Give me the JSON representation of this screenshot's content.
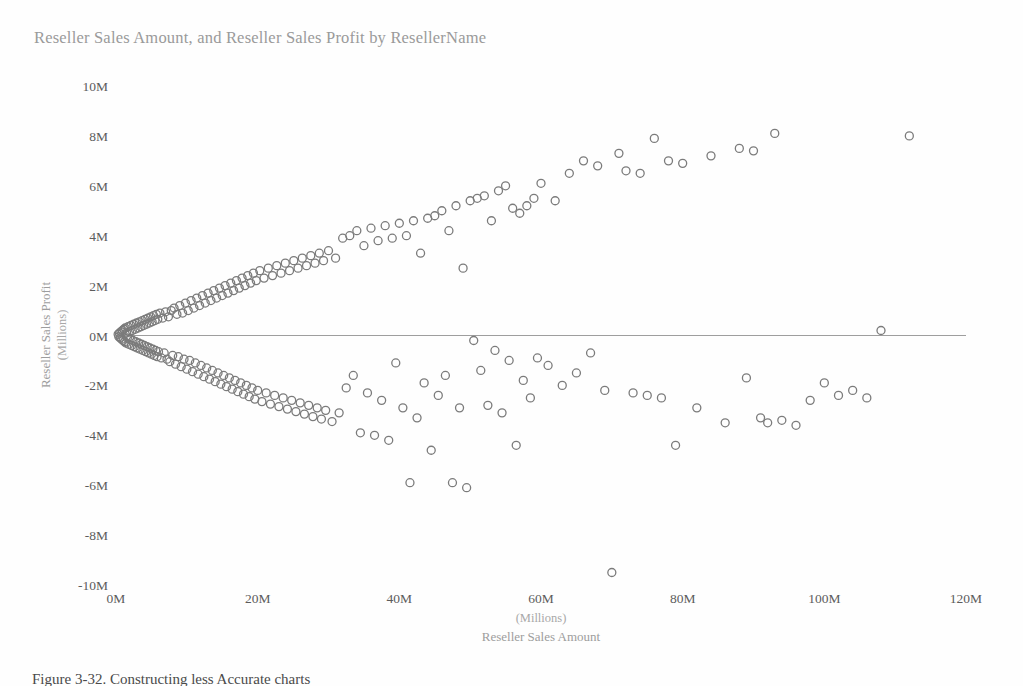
{
  "figure": {
    "title": "Reseller Sales Amount, and Reseller Sales Profit by ResellerName",
    "caption": "Figure 3-32.  Constructing less Accurate charts",
    "background_color": "#fefefe",
    "marker_color": "#7b7b7b",
    "title_color": "#9a9a9a",
    "tick_color": "#5c5c5c",
    "zero_line_color": "#9e9e9e"
  },
  "chart_data": {
    "type": "scatter",
    "title": "Reseller Sales Amount, and Reseller Sales Profit by ResellerName",
    "xlabel": "Reseller Sales Amount",
    "xlabel_units": "(Millions)",
    "ylabel": "Reseller Sales Profit",
    "ylabel_units": "(Millions)",
    "xlim": [
      0,
      120
    ],
    "ylim": [
      -10,
      10
    ],
    "xticks": [
      0,
      20,
      40,
      60,
      80,
      100,
      120
    ],
    "xtick_labels": [
      "0M",
      "20M",
      "40M",
      "60M",
      "80M",
      "100M",
      "120M"
    ],
    "yticks": [
      10,
      8,
      6,
      4,
      2,
      0,
      -2,
      -4,
      -6,
      -8,
      -10
    ],
    "ytick_labels": [
      "10M",
      "8M",
      "6M",
      "4M",
      "2M",
      "0M",
      "-2M",
      "-4M",
      "-6M",
      "-8M",
      "-10M"
    ],
    "grid": false,
    "zero_line": true,
    "legend": null,
    "marker": "open-circle",
    "marker_size": 8,
    "series": [
      {
        "name": "ResellerName",
        "points": [
          [
            0.3,
            0.05
          ],
          [
            0.4,
            -0.05
          ],
          [
            0.5,
            0.1
          ],
          [
            0.6,
            -0.1
          ],
          [
            0.7,
            0.15
          ],
          [
            0.8,
            -0.15
          ],
          [
            0.9,
            0.2
          ],
          [
            1.0,
            -0.2
          ],
          [
            1.1,
            0.25
          ],
          [
            1.2,
            -0.25
          ],
          [
            1.3,
            0.3
          ],
          [
            1.4,
            -0.3
          ],
          [
            1.5,
            0.1
          ],
          [
            1.6,
            -0.1
          ],
          [
            1.7,
            0.35
          ],
          [
            1.8,
            -0.35
          ],
          [
            1.9,
            0.15
          ],
          [
            2.0,
            -0.15
          ],
          [
            2.1,
            0.4
          ],
          [
            2.2,
            -0.4
          ],
          [
            2.3,
            0.2
          ],
          [
            2.4,
            -0.2
          ],
          [
            2.5,
            0.45
          ],
          [
            2.6,
            -0.45
          ],
          [
            2.7,
            0.25
          ],
          [
            2.8,
            -0.25
          ],
          [
            2.9,
            0.5
          ],
          [
            3.0,
            -0.5
          ],
          [
            3.1,
            0.3
          ],
          [
            3.2,
            -0.3
          ],
          [
            3.3,
            0.55
          ],
          [
            3.4,
            -0.55
          ],
          [
            3.5,
            0.35
          ],
          [
            3.6,
            -0.35
          ],
          [
            3.7,
            0.6
          ],
          [
            3.8,
            -0.6
          ],
          [
            3.9,
            0.4
          ],
          [
            4.0,
            -0.4
          ],
          [
            4.1,
            0.65
          ],
          [
            4.2,
            -0.65
          ],
          [
            4.3,
            0.45
          ],
          [
            4.4,
            -0.45
          ],
          [
            4.5,
            0.7
          ],
          [
            4.6,
            -0.7
          ],
          [
            4.7,
            0.5
          ],
          [
            4.8,
            -0.5
          ],
          [
            4.9,
            0.75
          ],
          [
            5.0,
            -0.75
          ],
          [
            5.1,
            0.55
          ],
          [
            5.2,
            -0.55
          ],
          [
            5.3,
            0.8
          ],
          [
            5.4,
            -0.8
          ],
          [
            5.5,
            0.6
          ],
          [
            5.6,
            -0.6
          ],
          [
            5.7,
            0.85
          ],
          [
            5.8,
            -0.85
          ],
          [
            5.9,
            0.65
          ],
          [
            6.0,
            -0.65
          ],
          [
            6.2,
            0.9
          ],
          [
            6.4,
            -0.9
          ],
          [
            6.6,
            0.7
          ],
          [
            6.8,
            -0.7
          ],
          [
            7.0,
            0.95
          ],
          [
            7.2,
            -0.95
          ],
          [
            7.4,
            0.75
          ],
          [
            7.6,
            -1.05
          ],
          [
            7.8,
            1.0
          ],
          [
            8.0,
            -0.8
          ],
          [
            8.2,
            1.1
          ],
          [
            8.4,
            -1.15
          ],
          [
            8.6,
            0.85
          ],
          [
            8.8,
            -0.85
          ],
          [
            9.0,
            1.2
          ],
          [
            9.2,
            -1.25
          ],
          [
            9.4,
            0.9
          ],
          [
            9.6,
            -0.95
          ],
          [
            9.8,
            1.3
          ],
          [
            10.0,
            -1.35
          ],
          [
            10.2,
            1.0
          ],
          [
            10.4,
            -1.0
          ],
          [
            10.6,
            1.4
          ],
          [
            10.8,
            -1.45
          ],
          [
            11.0,
            1.1
          ],
          [
            11.2,
            -1.1
          ],
          [
            11.4,
            1.5
          ],
          [
            11.6,
            -1.55
          ],
          [
            11.8,
            1.2
          ],
          [
            12.0,
            -1.2
          ],
          [
            12.2,
            1.6
          ],
          [
            12.4,
            -1.65
          ],
          [
            12.6,
            1.3
          ],
          [
            12.8,
            -1.3
          ],
          [
            13.0,
            1.7
          ],
          [
            13.2,
            -1.75
          ],
          [
            13.4,
            1.4
          ],
          [
            13.6,
            -1.4
          ],
          [
            13.8,
            1.8
          ],
          [
            14.0,
            -1.85
          ],
          [
            14.2,
            1.5
          ],
          [
            14.4,
            -1.5
          ],
          [
            14.6,
            1.9
          ],
          [
            14.8,
            -1.95
          ],
          [
            15.0,
            1.6
          ],
          [
            15.2,
            -1.6
          ],
          [
            15.4,
            2.0
          ],
          [
            15.6,
            -2.05
          ],
          [
            15.8,
            1.7
          ],
          [
            16.0,
            -1.7
          ],
          [
            16.2,
            2.1
          ],
          [
            16.4,
            -2.15
          ],
          [
            16.6,
            1.8
          ],
          [
            16.8,
            -1.8
          ],
          [
            17.0,
            2.2
          ],
          [
            17.2,
            -2.25
          ],
          [
            17.4,
            1.9
          ],
          [
            17.6,
            -1.9
          ],
          [
            17.8,
            2.3
          ],
          [
            18.0,
            -2.35
          ],
          [
            18.2,
            2.0
          ],
          [
            18.4,
            -2.0
          ],
          [
            18.6,
            2.4
          ],
          [
            18.8,
            -2.45
          ],
          [
            19.0,
            2.1
          ],
          [
            19.2,
            -2.1
          ],
          [
            19.4,
            2.5
          ],
          [
            19.6,
            -2.55
          ],
          [
            19.8,
            2.2
          ],
          [
            20.0,
            -2.2
          ],
          [
            20.3,
            2.6
          ],
          [
            20.6,
            -2.65
          ],
          [
            20.9,
            2.3
          ],
          [
            21.2,
            -2.3
          ],
          [
            21.5,
            2.7
          ],
          [
            21.8,
            -2.75
          ],
          [
            22.1,
            2.4
          ],
          [
            22.4,
            -2.4
          ],
          [
            22.7,
            2.8
          ],
          [
            23.0,
            -2.85
          ],
          [
            23.3,
            2.5
          ],
          [
            23.6,
            -2.5
          ],
          [
            23.9,
            2.9
          ],
          [
            24.2,
            -2.95
          ],
          [
            24.5,
            2.6
          ],
          [
            24.8,
            -2.6
          ],
          [
            25.1,
            3.0
          ],
          [
            25.4,
            -3.05
          ],
          [
            25.7,
            2.7
          ],
          [
            26.0,
            -2.7
          ],
          [
            26.3,
            3.1
          ],
          [
            26.6,
            -3.15
          ],
          [
            26.9,
            2.8
          ],
          [
            27.2,
            -2.8
          ],
          [
            27.5,
            3.2
          ],
          [
            27.8,
            -3.25
          ],
          [
            28.1,
            2.9
          ],
          [
            28.4,
            -2.9
          ],
          [
            28.7,
            3.3
          ],
          [
            29.0,
            -3.35
          ],
          [
            29.3,
            3.0
          ],
          [
            29.6,
            -3.0
          ],
          [
            30.0,
            3.4
          ],
          [
            30.5,
            -3.45
          ],
          [
            31.0,
            3.1
          ],
          [
            31.5,
            -3.1
          ],
          [
            32.0,
            3.9
          ],
          [
            32.5,
            -2.1
          ],
          [
            33.0,
            4.0
          ],
          [
            33.5,
            -1.6
          ],
          [
            34.0,
            4.2
          ],
          [
            34.5,
            -3.9
          ],
          [
            35.0,
            3.6
          ],
          [
            35.5,
            -2.3
          ],
          [
            36.0,
            4.3
          ],
          [
            36.5,
            -4.0
          ],
          [
            37.0,
            3.8
          ],
          [
            37.5,
            -2.6
          ],
          [
            38.0,
            4.4
          ],
          [
            38.5,
            -4.2
          ],
          [
            39.0,
            3.9
          ],
          [
            39.5,
            -1.1
          ],
          [
            40.0,
            4.5
          ],
          [
            40.5,
            -2.9
          ],
          [
            41.0,
            4.0
          ],
          [
            41.5,
            -5.9
          ],
          [
            42.0,
            4.6
          ],
          [
            42.5,
            -3.3
          ],
          [
            43.0,
            3.3
          ],
          [
            43.5,
            -1.9
          ],
          [
            44.0,
            4.7
          ],
          [
            44.5,
            -4.6
          ],
          [
            45.0,
            4.8
          ],
          [
            45.5,
            -2.4
          ],
          [
            46.0,
            5.0
          ],
          [
            46.5,
            -1.6
          ],
          [
            47.0,
            4.2
          ],
          [
            47.5,
            -5.9
          ],
          [
            48.0,
            5.2
          ],
          [
            48.5,
            -2.9
          ],
          [
            49.0,
            2.7
          ],
          [
            49.5,
            -6.1
          ],
          [
            50.0,
            5.4
          ],
          [
            50.5,
            -0.2
          ],
          [
            51.0,
            5.5
          ],
          [
            51.5,
            -1.4
          ],
          [
            52.0,
            5.6
          ],
          [
            52.5,
            -2.8
          ],
          [
            53.0,
            4.6
          ],
          [
            53.5,
            -0.6
          ],
          [
            54.0,
            5.8
          ],
          [
            54.5,
            -3.1
          ],
          [
            55.0,
            6.0
          ],
          [
            55.5,
            -1.0
          ],
          [
            56.0,
            5.1
          ],
          [
            56.5,
            -4.4
          ],
          [
            57.0,
            4.9
          ],
          [
            57.5,
            -1.8
          ],
          [
            58.0,
            5.2
          ],
          [
            58.5,
            -2.5
          ],
          [
            59.0,
            5.5
          ],
          [
            59.5,
            -0.9
          ],
          [
            60.0,
            6.1
          ],
          [
            61.0,
            -1.2
          ],
          [
            62.0,
            5.4
          ],
          [
            63.0,
            -2.0
          ],
          [
            64.0,
            6.5
          ],
          [
            65.0,
            -1.5
          ],
          [
            66.0,
            7.0
          ],
          [
            67.0,
            -0.7
          ],
          [
            68.0,
            6.8
          ],
          [
            69.0,
            -2.2
          ],
          [
            70.0,
            -9.5
          ],
          [
            71.0,
            7.3
          ],
          [
            72.0,
            6.6
          ],
          [
            73.0,
            -2.3
          ],
          [
            74.0,
            6.5
          ],
          [
            75.0,
            -2.4
          ],
          [
            76.0,
            7.9
          ],
          [
            77.0,
            -2.5
          ],
          [
            78.0,
            7.0
          ],
          [
            79.0,
            -4.4
          ],
          [
            80.0,
            6.9
          ],
          [
            82.0,
            -2.9
          ],
          [
            84.0,
            7.2
          ],
          [
            86.0,
            -3.5
          ],
          [
            88.0,
            7.5
          ],
          [
            89.0,
            -1.7
          ],
          [
            90.0,
            7.4
          ],
          [
            91.0,
            -3.3
          ],
          [
            92.0,
            -3.5
          ],
          [
            93.0,
            8.1
          ],
          [
            94.0,
            -3.4
          ],
          [
            96.0,
            -3.6
          ],
          [
            98.0,
            -2.6
          ],
          [
            100.0,
            -1.9
          ],
          [
            102.0,
            -2.4
          ],
          [
            104.0,
            -2.2
          ],
          [
            106.0,
            -2.5
          ],
          [
            108.0,
            0.2
          ],
          [
            112.0,
            8.0
          ]
        ]
      }
    ]
  },
  "axis": {
    "x_tick_labels": [
      "0M",
      "20M",
      "40M",
      "60M",
      "80M",
      "100M",
      "120M"
    ],
    "y_tick_labels": [
      "10M",
      "8M",
      "6M",
      "4M",
      "2M",
      "0M",
      "-2M",
      "-4M",
      "-6M",
      "-8M",
      "-10M"
    ]
  }
}
